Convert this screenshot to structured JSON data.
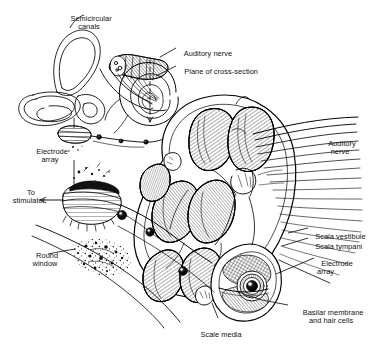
{
  "figure": {
    "style": "black-and-white pen-and-ink line drawing with cross-hatch shading",
    "background_color": "#ffffff",
    "ink_color": "#000000",
    "width": 380,
    "height": 347
  },
  "labels": [
    {
      "id": "semicircular-canals",
      "text": "Semicircular\ncanals",
      "x": 88,
      "y": 8,
      "align": "center"
    },
    {
      "id": "auditory-nerve-inset",
      "text": "Auditory nerve",
      "x": 180,
      "y": 44,
      "align": "left"
    },
    {
      "id": "plane-of-cross-section",
      "text": "Plane of cross-section",
      "x": 180,
      "y": 62,
      "align": "left"
    },
    {
      "id": "electrode-array-left",
      "text": "Electrode\narray",
      "x": 48,
      "y": 142,
      "align": "center"
    },
    {
      "id": "to-stimulator",
      "text": "To\nstimulator",
      "x": 27,
      "y": 183,
      "align": "center"
    },
    {
      "id": "round-window",
      "text": "Round\nwindow",
      "x": 45,
      "y": 246,
      "align": "center"
    },
    {
      "id": "auditory-nerve-right",
      "text": "Auditory\nnerve",
      "x": 340,
      "y": 135,
      "align": "center"
    },
    {
      "id": "scala-vestibule",
      "text": "Scala vestibule",
      "x": 312,
      "y": 227,
      "align": "left"
    },
    {
      "id": "scala-tympani",
      "text": "Scala tympani",
      "x": 312,
      "y": 237,
      "align": "left"
    },
    {
      "id": "electrode-array-right",
      "text": "Electrode\narray",
      "x": 318,
      "y": 254,
      "align": "left"
    },
    {
      "id": "basilar-membrane",
      "text": "Basilar membrane\nand hair cells",
      "x": 290,
      "y": 303,
      "align": "left"
    },
    {
      "id": "scale-media",
      "text": "Scale media",
      "x": 218,
      "y": 325,
      "align": "center"
    }
  ],
  "structures": [
    {
      "id": "inset-inner-ear",
      "name": "Inner ear overview inset (semicircular canals, vestibule, cochlear spiral)"
    },
    {
      "id": "cochlea-cross-section",
      "name": "Enlarged cochlea cross-section with stacked scalae chambers"
    },
    {
      "id": "auditory-nerve-fibers",
      "name": "Auditory nerve fiber bundle fanning to the right"
    },
    {
      "id": "electrode-array-lead",
      "name": "Electrode array lead with beaded electrode contacts"
    },
    {
      "id": "round-window-region",
      "name": "Round window stippled bone region"
    },
    {
      "id": "organ-of-corti",
      "name": "Organ of Corti / basilar membrane detail in lower turn"
    }
  ]
}
